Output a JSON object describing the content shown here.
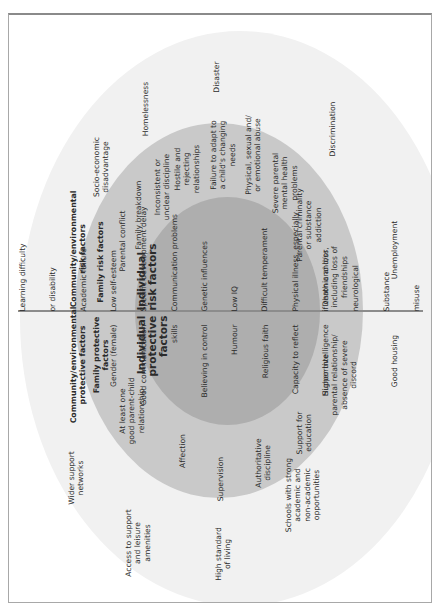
{
  "diagram": {
    "colors": {
      "outer_ring": "#f1f1f1",
      "middle_ring": "#c9c9c9",
      "inner_ring": "#aeaeae",
      "divider": "#8c8c8c",
      "frame": "#a8a8a8"
    },
    "risk": {
      "community": {
        "heading": "Community/environmental\nrisk factors",
        "items": [
          "Socio-economic\ndisadvantage",
          "Homelessness",
          "Disaster",
          "Discrimination",
          "Unemployment"
        ]
      },
      "family": {
        "heading": "Family risk factors",
        "items": [
          "Parental conflict",
          "Family breakdown",
          "Inconsistent or\nunclear discipline",
          "Hostile and\nrejecting\nrelationships",
          "Failure to adapt to\na child's changing\nneeds",
          "Physical, sexual and/\nor emotional abuse",
          "Severe parental\nmental health\nproblems",
          "Parental criminality\nor substance\naddiction",
          "Death and loss,\nincluding loss of\nfriendships"
        ]
      },
      "individual": {
        "heading": "Individual\nrisk factors",
        "items": [
          "Learning difficulty",
          "or disability",
          "Academic failure",
          "Low self-esteem",
          "Specific development delay",
          "Communication problems",
          "Genetic influences",
          "Low IQ",
          "Difficult temperament",
          "Physical illness, especially",
          "if chronic and/or",
          "neurological",
          "Substance",
          "misuse"
        ]
      }
    },
    "protective": {
      "community": {
        "heading": "Community/environmental\nprotective factors",
        "items": [
          "Wider support\nnetworks",
          "Access to support\nand leisure\namenities",
          "High standard\nof living",
          "Schools with strong\nacademic and\nnon-academic\nopportunities",
          "Good housing"
        ]
      },
      "family": {
        "heading": "Family protective\nfactors",
        "items": [
          "At least one\ngood parent-child\nrelationship",
          "Affection",
          "Supervision",
          "Authoritative\ndiscipline",
          "Support for\neducation",
          "Supportive\nparental relationship/\nabsence of severe\ndiscord"
        ]
      },
      "individual": {
        "heading": "Individual\nprotective\nfactors",
        "items": [
          "Gender (female)",
          "Good communication",
          "skills",
          "Believing in control",
          "Humour",
          "Religious faith",
          "Capacity to reflect",
          "Higher intelligence"
        ]
      }
    }
  }
}
